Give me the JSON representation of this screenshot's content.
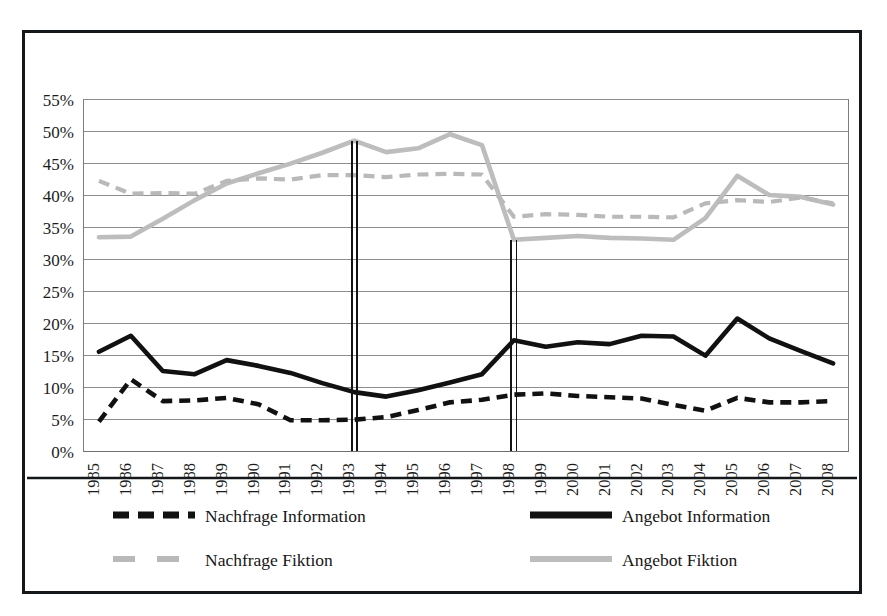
{
  "chart_data": {
    "type": "line",
    "title": "",
    "xlabel": "",
    "ylabel": "",
    "grid": true,
    "legend_position": "bottom",
    "ylim": [
      0,
      55
    ],
    "ytick_labels": [
      "55%",
      "50%",
      "45%",
      "40%",
      "35%",
      "30%",
      "25%",
      "20%",
      "15%",
      "10%",
      "5%",
      "0%"
    ],
    "ytick_values": [
      55,
      50,
      45,
      40,
      35,
      30,
      25,
      20,
      15,
      10,
      5,
      0
    ],
    "categories": [
      "1985",
      "1986",
      "1987",
      "1988",
      "1989",
      "1990",
      "1991",
      "1992",
      "1993",
      "1994",
      "1995",
      "1996",
      "1997",
      "1998",
      "1999",
      "2000",
      "2001",
      "2002",
      "2003",
      "2004",
      "2005",
      "2006",
      "2007",
      "2008"
    ],
    "annotations": [
      {
        "name": "vertical-marker-1993",
        "x": "1993",
        "y_top": 48.5,
        "y_bottom": 0
      },
      {
        "name": "vertical-marker-1998",
        "x": "1998",
        "y_top": 33.0,
        "y_bottom": 0
      }
    ],
    "series": [
      {
        "name": "Nachfrage Information",
        "color": "#111111",
        "style": "dashed",
        "width": 4.6,
        "values": [
          4.6,
          11.2,
          7.8,
          7.9,
          8.3,
          7.3,
          4.8,
          4.8,
          4.9,
          5.3,
          6.4,
          7.6,
          8.0,
          8.8,
          9.0,
          8.6,
          8.4,
          8.2,
          7.2,
          6.3,
          8.3,
          7.6,
          7.6,
          7.8
        ]
      },
      {
        "name": "Angebot Information",
        "color": "#111111",
        "style": "solid",
        "width": 4.6,
        "values": [
          15.5,
          18.0,
          12.5,
          12.0,
          14.2,
          13.3,
          12.2,
          10.6,
          9.2,
          8.5,
          9.5,
          10.7,
          12.0,
          17.3,
          16.3,
          17.0,
          16.7,
          18.0,
          17.9,
          14.9,
          20.7,
          17.6,
          15.6,
          13.7
        ]
      },
      {
        "name": "Nachfrage Fiktion",
        "color": "#b9b9b9",
        "style": "dashed",
        "width": 4.2,
        "values": [
          42.2,
          40.2,
          40.3,
          40.2,
          42.2,
          42.6,
          42.4,
          43.1,
          43.1,
          42.8,
          43.2,
          43.3,
          43.2,
          36.6,
          37.0,
          36.9,
          36.6,
          36.6,
          36.5,
          38.7,
          39.2,
          38.9,
          39.6,
          38.7
        ]
      },
      {
        "name": "Angebot Fiktion",
        "color": "#bdbdbd",
        "style": "solid",
        "width": 4.6,
        "values": [
          33.4,
          33.5,
          36.3,
          39.2,
          41.8,
          43.4,
          44.9,
          46.6,
          48.5,
          46.7,
          47.3,
          49.5,
          47.8,
          33.0,
          33.3,
          33.6,
          33.3,
          33.2,
          33.0,
          36.4,
          43.0,
          40.0,
          39.7,
          38.5
        ]
      }
    ]
  },
  "legend": {
    "entries": [
      {
        "label": "Nachfrage Information",
        "color": "#111111",
        "style": "dashed"
      },
      {
        "label": "Angebot Information",
        "color": "#111111",
        "style": "solid"
      },
      {
        "label": "Nachfrage Fiktion",
        "color": "#b9b9b9",
        "style": "dashed"
      },
      {
        "label": "Angebot Fiktion",
        "color": "#bdbdbd",
        "style": "solid"
      }
    ]
  }
}
